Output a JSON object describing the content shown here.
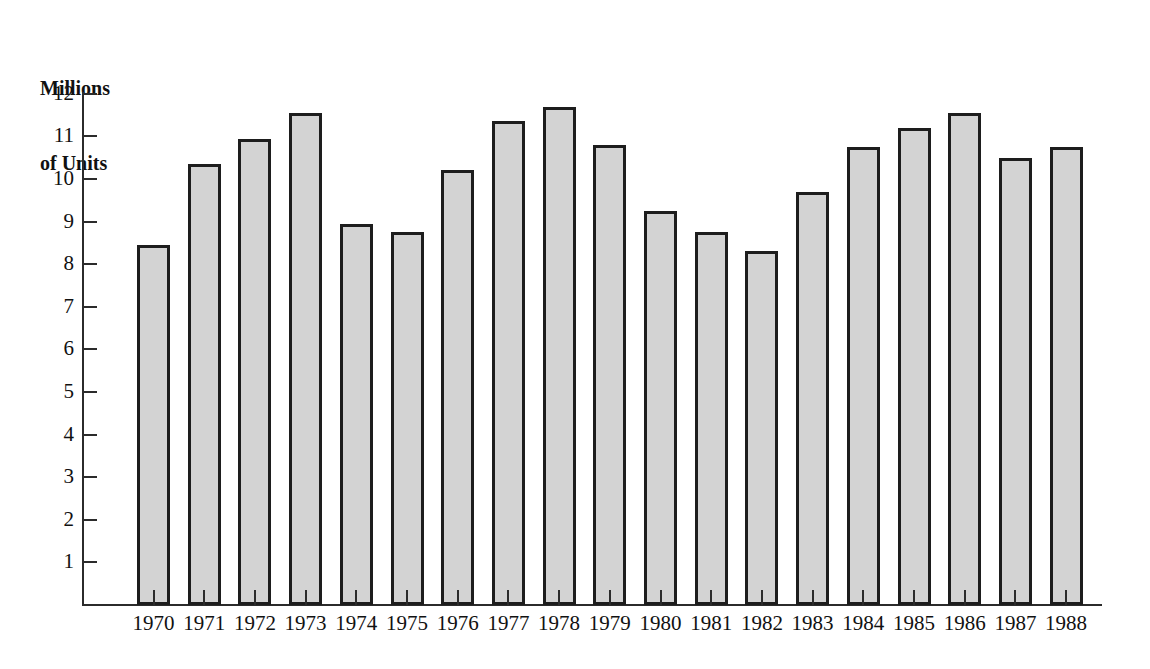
{
  "chart_data": {
    "type": "bar",
    "title": "Millions of Units",
    "title_lines": [
      "Millions",
      "of Units"
    ],
    "xlabel": "",
    "ylabel": "Millions of Units",
    "ylim": [
      0,
      12.25
    ],
    "ytick_labels": [
      "12",
      "11",
      "10",
      "9",
      "8",
      "7",
      "6",
      "5",
      "4",
      "3",
      "2",
      "1"
    ],
    "yticks": [
      12,
      11,
      10,
      9,
      8,
      7,
      6,
      5,
      4,
      3,
      2,
      1
    ],
    "grid": false,
    "legend": "none",
    "bar_fill_color": "#d3d3d3",
    "bar_edge_color": "#1d1d1d",
    "axis_color": "#2b2b2b",
    "background_color": "#ffffff",
    "categories": [
      "1970",
      "1971",
      "1972",
      "1973",
      "1974",
      "1975",
      "1976",
      "1977",
      "1978",
      "1979",
      "1980",
      "1981",
      "1982",
      "1983",
      "1984",
      "1985",
      "1986",
      "1987",
      "1988"
    ],
    "values": [
      8.45,
      10.35,
      10.95,
      11.55,
      8.95,
      8.75,
      10.2,
      11.35,
      11.7,
      10.8,
      9.25,
      8.75,
      8.3,
      9.7,
      10.75,
      11.2,
      11.55,
      10.5,
      10.75
    ]
  }
}
